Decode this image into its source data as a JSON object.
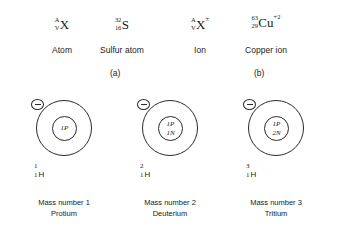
{
  "notation": {
    "groups": [
      {
        "mass_number": "A",
        "atomic_number": "V",
        "symbol": "X",
        "charge": "",
        "label": "Atom"
      },
      {
        "mass_number": "32",
        "atomic_number": "16",
        "symbol": "S",
        "charge": "",
        "label": "Sulfur atom"
      },
      {
        "mass_number": "A",
        "atomic_number": "V",
        "symbol": "X",
        "charge": "±",
        "label": "Ion"
      },
      {
        "mass_number": "63",
        "atomic_number": "29",
        "symbol": "Cu",
        "charge": "+2",
        "label": "Copper ion"
      }
    ],
    "panel_a": "(a)",
    "panel_b": "(b)"
  },
  "isotopes": [
    {
      "nucleus_protons": "1P",
      "nucleus_neutrons": "",
      "mass_number": "1",
      "atomic_number": "1",
      "element_symbol": "H",
      "caption_line1": "Mass number 1",
      "caption_line2": "Protium",
      "electron_charge": "−"
    },
    {
      "nucleus_protons": "1P",
      "nucleus_neutrons": "1N",
      "mass_number": "2",
      "atomic_number": "1",
      "element_symbol": "H",
      "caption_line1": "Mass number 2",
      "caption_line2": "Deuterium",
      "electron_charge": "−"
    },
    {
      "nucleus_protons": "1P",
      "nucleus_neutrons": "2N",
      "mass_number": "3",
      "atomic_number": "1",
      "element_symbol": "H",
      "caption_line1": "Mass number 3",
      "caption_line2": "Tritium",
      "electron_charge": "−"
    }
  ],
  "colors": {
    "background": "#ffffff",
    "line": "#2b2b2b",
    "text": "#1a1a1a"
  }
}
